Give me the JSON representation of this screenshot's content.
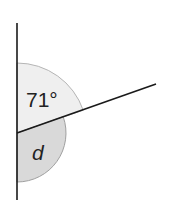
{
  "diagram": {
    "type": "angles-on-a-straight-line",
    "vertex": {
      "x": 17,
      "y": 133
    },
    "vertical_line": {
      "x": 17,
      "y_top": 23,
      "y_bottom": 200
    },
    "ray": {
      "x_end": 156,
      "y_end": 84
    },
    "angles": [
      {
        "id": "known",
        "label": "71°",
        "value_degrees": 71,
        "fill": "#efefef",
        "stroke": "#b5b5b5",
        "radius": 70
      },
      {
        "id": "unknown",
        "label": "d",
        "value_degrees": 109,
        "fill": "#d9d9d9",
        "stroke": "#a0a0a0",
        "radius": 49
      }
    ],
    "colors": {
      "line": "#1a1a1a",
      "text": "#222222",
      "background": "#ffffff"
    }
  }
}
